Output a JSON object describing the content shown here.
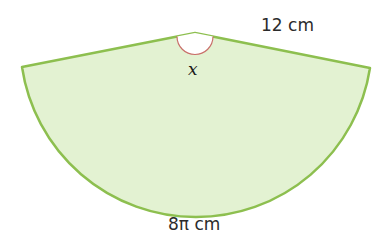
{
  "diagram": {
    "type": "sector",
    "labels": {
      "radius": "12 cm",
      "arc_length": "8π cm",
      "angle": "x"
    },
    "colors": {
      "fill": "#e3f2d2",
      "outline": "#8dbf4f",
      "angle_arc": "#c9706a",
      "angle_fill": "#ffffff",
      "text": "#2b2b2b"
    }
  }
}
